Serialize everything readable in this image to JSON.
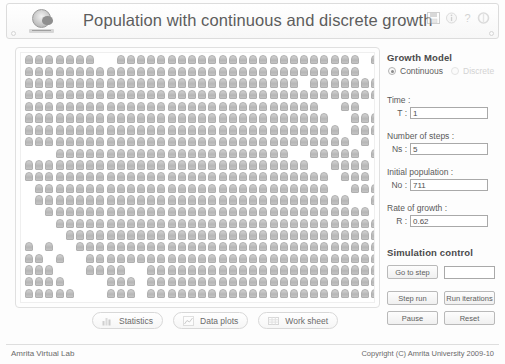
{
  "header": {
    "title": "Population with continuous and discrete growth",
    "logo_name": "amrita-emblem-logo",
    "icons": [
      {
        "name": "save-icon",
        "glyph": "save"
      },
      {
        "name": "info-icon",
        "glyph": "info"
      },
      {
        "name": "help-icon",
        "glyph": "?"
      },
      {
        "name": "refresh-icon",
        "glyph": "refresh"
      }
    ]
  },
  "grid": {
    "name": "population-grid",
    "columns": 35,
    "rows": 21,
    "filled_count": 711,
    "empty_indices": [
      7,
      8,
      33,
      68,
      69,
      97,
      173,
      174,
      279,
      280,
      281,
      282,
      306,
      307,
      343,
      344,
      380,
      415,
      416,
      452,
      453,
      489,
      525,
      526,
      561,
      597,
      633,
      669,
      705,
      640,
      641,
      676,
      711,
      455,
      490,
      491,
      527,
      563,
      564,
      599,
      600,
      635,
      671,
      672,
      707,
      169,
      170,
      205,
      206,
      241,
      277,
      313,
      349,
      384,
      385,
      420,
      456,
      492,
      528,
      563,
      599,
      634,
      670,
      706
    ],
    "cell_color": "#b6b6b6"
  },
  "toolbar": {
    "buttons": [
      {
        "label": "Statistics",
        "icon": "chart-bars-icon"
      },
      {
        "label": "Data plots",
        "icon": "line-plot-icon"
      },
      {
        "label": "Work sheet",
        "icon": "spreadsheet-icon"
      }
    ]
  },
  "growth_model": {
    "section_title": "Growth Model",
    "options": [
      {
        "label": "Continuous",
        "selected": true,
        "enabled": true
      },
      {
        "label": "Discrete",
        "selected": false,
        "enabled": false
      }
    ],
    "fields": [
      {
        "label": "Time :",
        "key": "T :",
        "value": "1",
        "name": "time-input"
      },
      {
        "label": "Number of steps :",
        "key": "Ns :",
        "value": "5",
        "name": "number-of-steps-input"
      },
      {
        "label": "Initial population :",
        "key": "No :",
        "value": "711",
        "name": "initial-population-input"
      },
      {
        "label": "Rate of growth :",
        "key": "R :",
        "value": "0.62",
        "name": "rate-of-growth-input"
      }
    ]
  },
  "simulation_control": {
    "section_title": "Simulation control",
    "goto_button": "Go to step",
    "goto_value": "",
    "buttons": [
      {
        "label": "Step run",
        "name": "step-run-button"
      },
      {
        "label": "Run iterations",
        "name": "run-iterations-button"
      },
      {
        "label": "Pause",
        "name": "pause-button"
      },
      {
        "label": "Reset",
        "name": "reset-button"
      }
    ]
  },
  "footer": {
    "left": "Amrita Virtual Lab",
    "right": "Copyright (C) Amrita University 2009-10"
  }
}
